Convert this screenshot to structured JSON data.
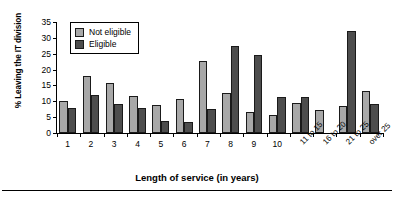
{
  "chart_data": {
    "type": "bar",
    "title": "",
    "xlabel": "Length of service (in years)",
    "ylabel": "% Leaving the IT division",
    "ylim": [
      0,
      35
    ],
    "yticks": [
      0,
      5,
      10,
      15,
      20,
      25,
      30,
      35
    ],
    "grid": false,
    "legend_position": "upper-left-inside",
    "categories": [
      "1",
      "2",
      "3",
      "4",
      "5",
      "6",
      "7",
      "8",
      "9",
      "10",
      "11 to 15",
      "16 to 20",
      "21 to 25",
      "over 25"
    ],
    "rotated_categories": [
      "11 to 15",
      "16 to 20",
      "21 to 25",
      "over 25"
    ],
    "series": [
      {
        "name": "Not eligible",
        "color": "#a8a8a8",
        "values": [
          10.0,
          18.1,
          15.8,
          11.8,
          8.8,
          10.7,
          22.7,
          12.7,
          6.7,
          5.8,
          9.4,
          7.3,
          8.4,
          13.2
        ]
      },
      {
        "name": "Eligible",
        "color": "#4d4d4d",
        "values": [
          8.0,
          11.9,
          9.0,
          7.9,
          3.8,
          3.6,
          7.7,
          27.5,
          24.5,
          11.4,
          11.2,
          null,
          32.3,
          9.3
        ]
      }
    ]
  }
}
